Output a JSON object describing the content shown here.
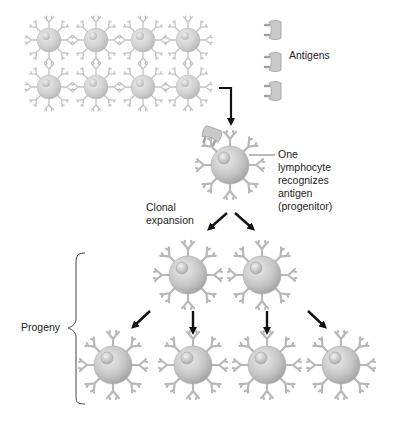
{
  "diagram": {
    "labels": {
      "antigens": "Antigens",
      "recognizer_1": "One",
      "recognizer_2": "lymphocyte",
      "recognizer_3": "recognizes",
      "recognizer_4": "antigen",
      "recognizer_5": "(progenitor)",
      "clonal_1": "Clonal",
      "clonal_2": "expansion",
      "progeny": "Progeny"
    },
    "colors": {
      "cell_faded": "#bdbdbd",
      "cell_body": "#c8c8c8",
      "arrow": "#111111",
      "text": "#222222"
    },
    "nodes": {
      "initial_population_count": 8,
      "antigen_count": 3,
      "progenitor_count": 1,
      "first_generation_count": 2,
      "second_generation_count": 4
    }
  }
}
